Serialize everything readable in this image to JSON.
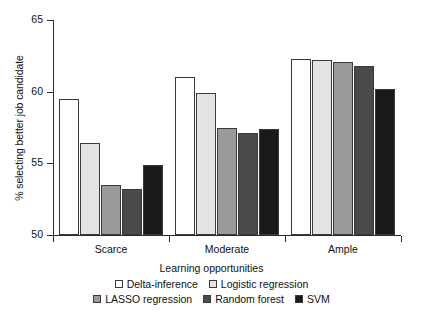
{
  "chart_data": {
    "type": "bar",
    "title": "",
    "xlabel": "Learning opportunities",
    "ylabel": "% selecting better job candidate",
    "categories": [
      "Scarce",
      "Moderate",
      "Ample"
    ],
    "ylim": [
      50,
      65
    ],
    "yticks": [
      50,
      55,
      60,
      65
    ],
    "ytick_labels": [
      "50",
      "55",
      "60",
      "65"
    ],
    "grid": false,
    "legend_position": "bottom",
    "series": [
      {
        "name": "Delta-inference",
        "color": "#ffffff",
        "values": [
          59.5,
          61.0,
          62.3
        ]
      },
      {
        "name": "Logistic regression",
        "color": "#e3e3e3",
        "values": [
          56.4,
          59.9,
          62.2
        ]
      },
      {
        "name": "LASSO regression",
        "color": "#9a9a9a",
        "values": [
          53.5,
          57.5,
          62.1
        ]
      },
      {
        "name": "Random forest",
        "color": "#4a4a4a",
        "values": [
          53.2,
          57.1,
          61.8
        ]
      },
      {
        "name": "SVM",
        "color": "#1a1a1a",
        "values": [
          54.9,
          57.4,
          60.2
        ]
      }
    ]
  }
}
